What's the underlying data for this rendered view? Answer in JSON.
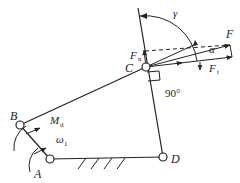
{
  "diagram": {
    "points": {
      "A": {
        "label": "A",
        "x": 50,
        "y": 159
      },
      "B": {
        "label": "B",
        "x": 20,
        "y": 125
      },
      "C": {
        "label": "C",
        "x": 146,
        "y": 67
      },
      "D": {
        "label": "D",
        "x": 163,
        "y": 157
      }
    },
    "labels": {
      "A": "A",
      "B": "B",
      "C": "C",
      "D": "D",
      "force_total": "F",
      "force_normal": "F",
      "force_normal_sub": "n",
      "force_tangent": "F",
      "force_tangent_sub": "t",
      "pressure_angle": "α",
      "transmission_angle": "γ",
      "right_angle": "90°",
      "driving_moment": "M",
      "driving_moment_sub": "d",
      "angular_velocity": "ω",
      "angular_velocity_sub": "1"
    },
    "colors": {
      "line": "#222222",
      "background": "#ffffff"
    }
  }
}
